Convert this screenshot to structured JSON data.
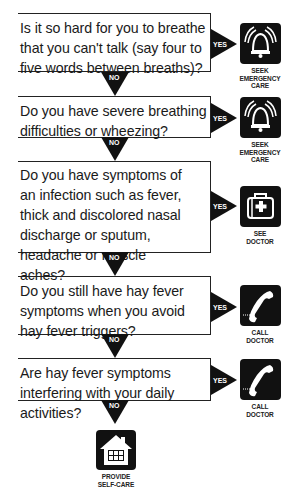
{
  "colors": {
    "ink": "#111111",
    "background": "#ffffff",
    "arrow_text": "#ffffff"
  },
  "arrows": {
    "yes_label": "YES",
    "no_label": "NO"
  },
  "questions": [
    {
      "text": "Is it so hard for you to breathe that you can't talk (say four to five words between breaths)?",
      "yes_action": {
        "icon": "bell-icon",
        "label_lines": [
          "SEEK",
          "EMERGENCY",
          "CARE"
        ]
      }
    },
    {
      "text": "Do you have severe breathing difficulties or wheezing?",
      "yes_action": {
        "icon": "bell-icon",
        "label_lines": [
          "SEEK",
          "EMERGENCY",
          "CARE"
        ]
      }
    },
    {
      "text": "Do you have symptoms of an infection such as fever, thick and discolored nasal discharge or sputum, headache or muscle aches?",
      "yes_action": {
        "icon": "medical-bag-icon",
        "label_lines": [
          "SEE",
          "DOCTOR"
        ]
      }
    },
    {
      "text": "Do you still have hay fever symptoms when you avoid hay fever triggers?",
      "yes_action": {
        "icon": "phone-icon",
        "label_lines": [
          "CALL",
          "DOCTOR"
        ]
      }
    },
    {
      "text": "Are hay fever symptoms interfering with your daily activities?",
      "yes_action": {
        "icon": "phone-icon",
        "label_lines": [
          "CALL",
          "DOCTOR"
        ]
      }
    }
  ],
  "final_no_action": {
    "icon": "house-icon",
    "label_lines": [
      "PROVIDE",
      "SELF-CARE"
    ]
  }
}
